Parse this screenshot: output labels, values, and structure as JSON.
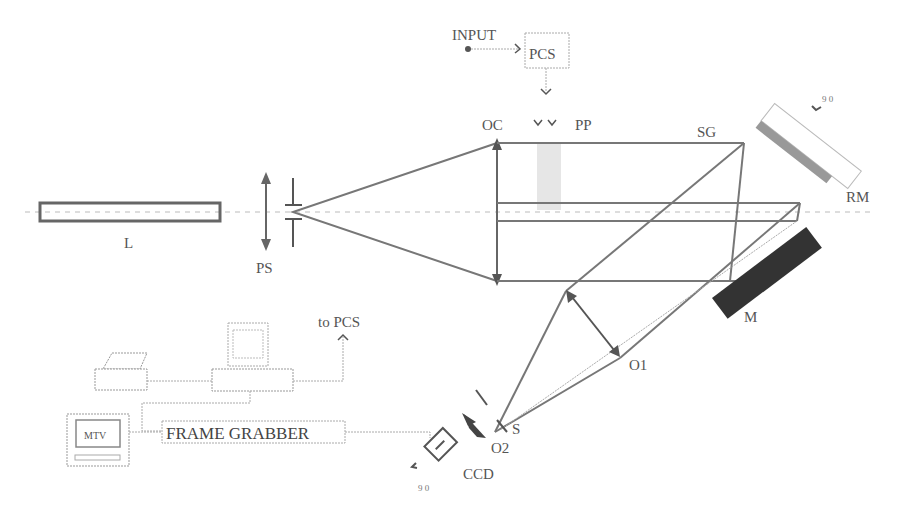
{
  "diagram": {
    "type": "optical-setup-schematic",
    "components": {
      "laser": {
        "label": "L"
      },
      "pinhole_spatial_filter": {
        "label": "PS"
      },
      "collimator_lens": {
        "label": "OC"
      },
      "phase_plate": {
        "label": "PP"
      },
      "phase_control": {
        "label": "PCS"
      },
      "input": {
        "label": "INPUT"
      },
      "grating": {
        "label": "SG"
      },
      "reference_mirror": {
        "label": "RM"
      },
      "rotation_rm": {
        "label": "9 0"
      },
      "mirror": {
        "label": "M"
      },
      "objective_1": {
        "label": "O1"
      },
      "objective_2": {
        "label": "O2"
      },
      "slit": {
        "label": "S"
      },
      "camera": {
        "label": "CCD"
      },
      "rotation_ccd": {
        "label": "9 0"
      },
      "frame_grabber": {
        "label": "FRAME GRABBER"
      },
      "monitor": {
        "label": "MTV"
      },
      "to_pcs": {
        "label": "to PCS"
      }
    },
    "colors": {
      "beam": "#777777",
      "mirror_dark": "#333333",
      "grating_gray": "#999999",
      "text": "#555555"
    }
  }
}
